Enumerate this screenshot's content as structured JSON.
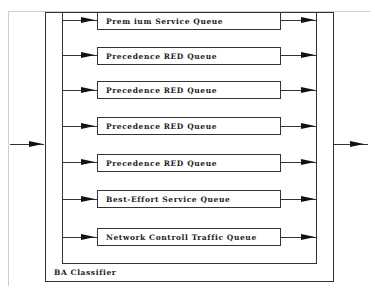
{
  "diagram": {
    "classifier_label": "BA Classifier",
    "queues": [
      {
        "label": "Prem ium Service Queue"
      },
      {
        "label": "Precedence RED Queue"
      },
      {
        "label": "Precedence RED Queue"
      },
      {
        "label": "Precedence RED Queue"
      },
      {
        "label": "Precedence RED Queue"
      },
      {
        "label": "Best-Effort Service Queue"
      },
      {
        "label": "Network Controll Traffic Queue"
      }
    ],
    "colors": {
      "line": "#333333",
      "arrow": "#111111",
      "background": "#ffffff"
    }
  }
}
